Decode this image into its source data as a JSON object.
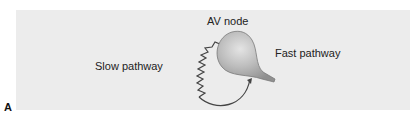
{
  "figure": {
    "panel_label": "A",
    "labels": {
      "av_node": "AV node",
      "slow_pathway": "Slow pathway",
      "fast_pathway": "Fast pathway"
    },
    "colors": {
      "panel_background": "#ececec",
      "node_fill": "#b8b8b8",
      "line": "#444444"
    }
  }
}
